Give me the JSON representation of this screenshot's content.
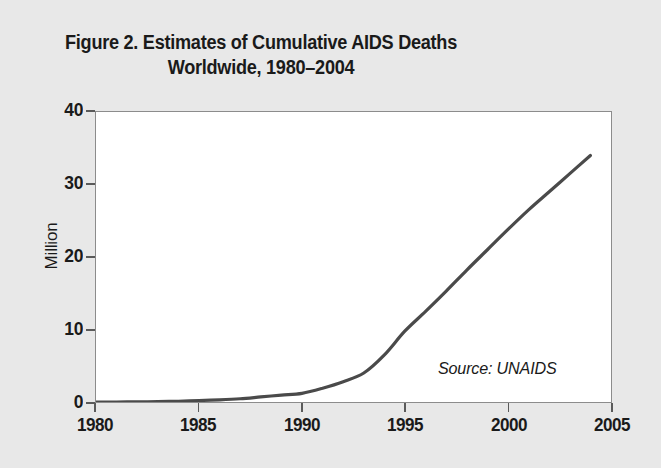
{
  "figure": {
    "title": "Figure 2. Estimates of Cumulative AIDS Deaths\nWorldwide, 1980–2004",
    "background_color": "#e8e8e8",
    "plot_background_color": "#ffffff",
    "frame_color": "#8c8c8c"
  },
  "chart_data": {
    "type": "line",
    "title": "Figure 2. Estimates of Cumulative AIDS Deaths Worldwide, 1980–2004",
    "subtitle": "",
    "xlabel": "",
    "ylabel": "Million",
    "xlim": [
      1980,
      2005
    ],
    "ylim": [
      0,
      40
    ],
    "grid": false,
    "legend": null,
    "annotations": [
      {
        "text": "Source: UNAIDS",
        "position": "inside-lower-right",
        "style": "italic"
      }
    ],
    "xticks": [
      1980,
      1985,
      1990,
      1995,
      2000,
      2005
    ],
    "xtick_labels": [
      "1980",
      "1985",
      "1990",
      "1995",
      "2000",
      "2005"
    ],
    "yticks": [
      0,
      10,
      20,
      30,
      40
    ],
    "ytick_labels": [
      "0",
      "10",
      "20",
      "30",
      "40"
    ],
    "series": [
      {
        "name": "Cumulative AIDS deaths worldwide",
        "color": "#4a4a4a",
        "line_width": 3,
        "x": [
          1980,
          1981,
          1982,
          1983,
          1984,
          1985,
          1986,
          1987,
          1988,
          1989,
          1990,
          1991,
          1992,
          1993,
          1994,
          1995,
          1996,
          1997,
          1998,
          1999,
          2000,
          2001,
          2002,
          2003,
          2004
        ],
        "values": [
          0.0,
          0.0,
          0.02,
          0.05,
          0.1,
          0.2,
          0.3,
          0.45,
          0.7,
          0.95,
          1.2,
          1.9,
          2.8,
          4.0,
          6.5,
          9.8,
          12.5,
          15.3,
          18.2,
          21.0,
          23.8,
          26.5,
          29.0,
          31.5,
          34.0
        ]
      }
    ]
  },
  "axes": {
    "y_title": "Million",
    "source_note": "Source: UNAIDS"
  }
}
